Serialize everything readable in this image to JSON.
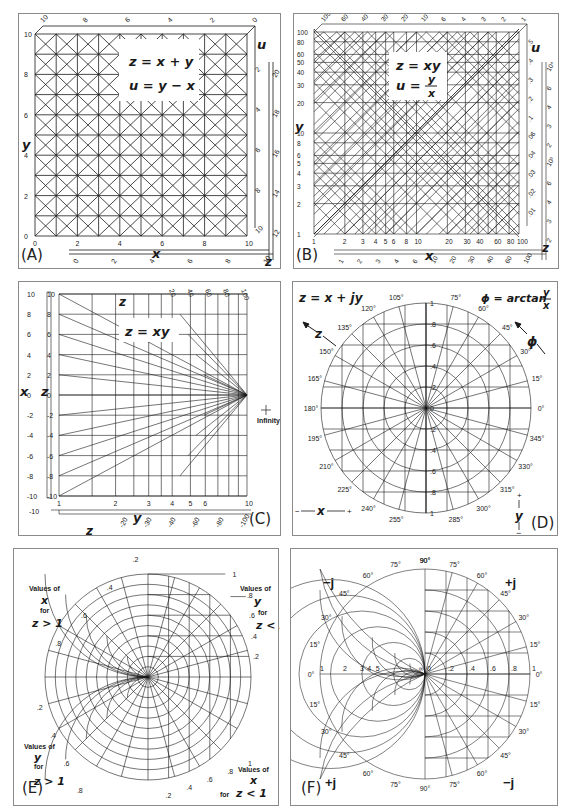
{
  "figure": {
    "panels": [
      {
        "id": "A",
        "label": "(A)",
        "title_eq1": "z = x + y",
        "title_eq2": "u = y − x",
        "x_axis_label": "x",
        "y_axis_label": "y",
        "u_axis_label": "u",
        "z_axis_label": "z",
        "x_ticks": [
          "0",
          "2",
          "4",
          "6",
          "8",
          "10"
        ],
        "y_ticks": [
          "0",
          "2",
          "4",
          "6",
          "8",
          "10"
        ],
        "u_ticks_top": [
          "10",
          "8",
          "6",
          "4",
          "2",
          "0"
        ],
        "u_ticks_right": [
          "2",
          "4",
          "6",
          "8",
          "10"
        ],
        "z_ticks_bottom": [
          "0",
          "2",
          "4",
          "6",
          "8",
          "10"
        ],
        "z_ticks_right": [
          "12",
          "14",
          "16",
          "18",
          "20"
        ]
      },
      {
        "id": "B",
        "label": "(B)",
        "title_eq1": "z = xy",
        "title_eq2_lhs": "u =",
        "title_eq2_num": "y",
        "title_eq2_den": "x",
        "x_axis_label": "x",
        "y_axis_label": "y",
        "u_axis_label": "u",
        "z_axis_label": "z",
        "x_ticks": [
          "1",
          "2",
          "3",
          "4",
          "5",
          "6",
          "8",
          "10",
          "20",
          "30",
          "40",
          "60",
          "80",
          "100"
        ],
        "y_ticks": [
          "1",
          "2",
          "3",
          "4",
          "5",
          "6",
          "8",
          "10",
          "20",
          "30",
          "40",
          "50",
          "60",
          "80",
          "100"
        ],
        "u_ticks_top": [
          "100",
          "60",
          "40",
          "30",
          "20",
          "10",
          "6",
          "4",
          "3",
          "2",
          "1"
        ],
        "u_ticks_right": [
          ".5",
          ".4",
          ".3",
          ".2",
          ".1",
          ".06",
          ".04",
          ".03",
          ".02",
          ".01"
        ],
        "z_ticks_bottom": [
          "1",
          "2",
          "3",
          "4",
          "6",
          "10",
          "20",
          "30",
          "40",
          "60",
          "100"
        ],
        "z_ticks_right": [
          "10⁴",
          "6",
          "4",
          "3",
          "2",
          "10³",
          "6",
          "4",
          "3",
          "2"
        ]
      },
      {
        "id": "C",
        "label": "(C)",
        "title_eq": "z = xy",
        "x_axis_label": "x",
        "y_axis_label": "y",
        "z_axis_label_left": "z",
        "z_axis_label_top": "z",
        "z_axis_label_bottom": "z",
        "annotation": "Infinity point",
        "x_ticks": [
          "10",
          "8",
          "6",
          "4",
          "2",
          "0",
          "-2",
          "-4",
          "-6",
          "-8",
          "-10"
        ],
        "z_ticks_left": [
          "10",
          "8",
          "6",
          "4",
          "2",
          "0",
          "-2",
          "-4",
          "-6",
          "-8",
          "-10"
        ],
        "y_ticks": [
          "1",
          "2",
          "3",
          "4",
          "5",
          "6",
          "10"
        ],
        "z_ticks_top": [
          "20",
          "40",
          "60",
          "80",
          "100"
        ],
        "z_ticks_bottom": [
          "-10",
          "-20",
          "-30",
          "-40",
          "-60",
          "-80",
          "-100"
        ]
      },
      {
        "id": "D",
        "label": "(D)",
        "title_eq_left": "z = x + jy",
        "title_eq_right_lhs": "ϕ = arctan",
        "title_eq_right_num": "y",
        "title_eq_right_den": "x",
        "z_arrow_label": "z",
        "phi_arrow_label": "ϕ",
        "x_axis_legend": "x",
        "x_minus": "−",
        "x_plus": "+",
        "y_axis_legend": "y",
        "y_plus": "+",
        "y_minus": "−",
        "radial_ticks": [
          "1",
          ".8",
          ".6",
          ".4",
          ".2",
          "0",
          ".2",
          ".4",
          ".6",
          ".8",
          "1"
        ],
        "angle_labels": [
          "0°",
          "15°",
          "30°",
          "45°",
          "60°",
          "75°",
          "105°",
          "120°",
          "135°",
          "150°",
          "165°",
          "180°",
          "195°",
          "210°",
          "225°",
          "240°",
          "255°",
          "285°",
          "300°",
          "315°",
          "330°",
          "345°"
        ]
      },
      {
        "id": "E",
        "label": "(E)",
        "note_top_left": [
          "Values of",
          "x",
          "for",
          "z > 1"
        ],
        "note_top_right": [
          "Values of",
          "y",
          "for",
          "z < 1"
        ],
        "note_bottom_left": [
          "Values of",
          "y",
          "for",
          "z > 1"
        ],
        "note_bottom_right": [
          "Values of",
          "x",
          "for",
          "z < 1"
        ],
        "right_ticks": [
          "1",
          ".8",
          ".6",
          ".4",
          ".2"
        ],
        "bottom_ticks": [
          ".2",
          ".4",
          ".6",
          ".8",
          "1"
        ],
        "top_left_ticks": [
          ".2",
          ".4",
          ".6",
          ".8"
        ],
        "bottom_left_ticks": [
          ".2",
          ".4",
          ".6",
          ".8"
        ]
      },
      {
        "id": "F",
        "label": "(F)",
        "quadrant_labels": {
          "top_left": "−j",
          "top_right": "+j",
          "bottom_left": "+j",
          "bottom_right": "−j"
        },
        "axis_ticks_left": [
          "1",
          "2",
          "3",
          "4",
          "5",
          "∞"
        ],
        "axis_ticks_right": [
          "0",
          ".2",
          ".4",
          ".6",
          ".8",
          "1"
        ],
        "angle_labels_right": [
          "0°",
          "15°",
          "30°",
          "45°",
          "60°",
          "75°",
          "90°"
        ],
        "angle_labels_left": [
          "0°",
          "15°",
          "30°",
          "45°",
          "60°",
          "75°",
          "90°"
        ]
      }
    ]
  },
  "colors": {
    "ink": "#1a1a1a",
    "frame": "#8a8a8a",
    "paper": "#ffffff"
  }
}
